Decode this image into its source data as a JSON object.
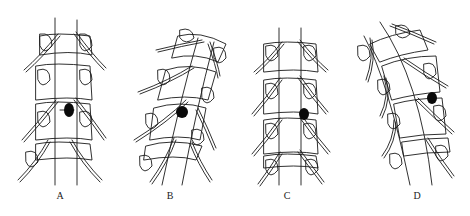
{
  "figure": {
    "panels": [
      {
        "id": "A",
        "label": "A",
        "spine_shape": "straight",
        "lesion_position": "central-right"
      },
      {
        "id": "B",
        "label": "B",
        "spine_shape": "tilted",
        "lesion_position": "central"
      },
      {
        "id": "C",
        "label": "C",
        "spine_shape": "straight",
        "lesion_position": "lateral-right"
      },
      {
        "id": "D",
        "label": "D",
        "spine_shape": "curved",
        "lesion_position": "lateral-right"
      }
    ],
    "caption": "",
    "colors": {
      "line": "#1a1a1a",
      "lesion": "#0a0a0a",
      "background": "#ffffff"
    }
  }
}
